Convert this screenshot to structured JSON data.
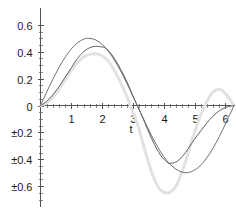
{
  "chart_data": {
    "type": "line",
    "title": "",
    "subtitle": "",
    "xlabel": "t",
    "ylabel": "",
    "xlim": [
      0,
      6.3
    ],
    "ylim": [
      -0.7,
      0.65
    ],
    "grid": false,
    "legend": null,
    "x_ticks": [
      {
        "value": 1,
        "label": "1"
      },
      {
        "value": 2,
        "label": "2"
      },
      {
        "value": 3,
        "label": "3"
      },
      {
        "value": 4,
        "label": "4"
      },
      {
        "value": 5,
        "label": "5"
      },
      {
        "value": 6,
        "label": "6"
      }
    ],
    "y_ticks": [
      {
        "value": 0.6,
        "label": "0.6"
      },
      {
        "value": 0.4,
        "label": "0.4"
      },
      {
        "value": 0.2,
        "label": "0.2"
      },
      {
        "value": 0,
        "label": "0"
      },
      {
        "value": -0.2,
        "label": "±0.2"
      },
      {
        "value": -0.4,
        "label": "±0.4"
      },
      {
        "value": -0.6,
        "label": "±0.6"
      }
    ],
    "series": [
      {
        "name": "curve-1",
        "color": "#707070",
        "width": 1,
        "x": [
          0,
          0.2,
          0.4,
          0.6,
          0.8,
          1.0,
          1.2,
          1.4,
          1.571,
          1.8,
          2.0,
          2.2,
          2.4,
          2.6,
          2.8,
          3.0,
          3.142,
          3.3,
          3.5,
          3.7,
          3.9,
          4.1,
          4.3,
          4.5,
          4.712,
          4.9,
          5.1,
          5.3,
          5.5,
          5.7,
          5.9,
          6.1,
          6.283
        ],
        "y": [
          0,
          0.099,
          0.195,
          0.282,
          0.359,
          0.421,
          0.466,
          0.493,
          0.5,
          0.487,
          0.455,
          0.404,
          0.338,
          0.258,
          0.167,
          0.071,
          0,
          -0.078,
          -0.175,
          -0.265,
          -0.345,
          -0.41,
          -0.456,
          -0.487,
          -0.5,
          -0.492,
          -0.465,
          -0.419,
          -0.355,
          -0.277,
          -0.187,
          -0.09,
          0
        ]
      },
      {
        "name": "curve-2",
        "color": "#606060",
        "width": 1,
        "x": [
          0,
          0.2,
          0.4,
          0.6,
          0.8,
          1.0,
          1.2,
          1.4,
          1.6,
          1.8,
          2.0,
          2.1,
          2.2,
          2.4,
          2.6,
          2.8,
          3.0,
          3.142,
          3.3,
          3.5,
          3.7,
          3.9,
          4.1,
          4.2,
          4.4,
          4.6,
          4.8,
          5.0,
          5.2,
          5.4,
          5.6,
          5.8,
          6.0,
          6.283
        ],
        "y": [
          0,
          0.03,
          0.08,
          0.14,
          0.21,
          0.28,
          0.35,
          0.4,
          0.43,
          0.44,
          0.435,
          0.43,
          0.41,
          0.35,
          0.27,
          0.18,
          0.07,
          0,
          -0.08,
          -0.19,
          -0.29,
          -0.37,
          -0.42,
          -0.43,
          -0.42,
          -0.38,
          -0.32,
          -0.25,
          -0.19,
          -0.13,
          -0.08,
          -0.04,
          -0.015,
          0
        ]
      },
      {
        "name": "curve-3",
        "color": "#e2e2e2",
        "width": 3,
        "x": [
          0,
          0.2,
          0.4,
          0.6,
          0.8,
          1.0,
          1.2,
          1.4,
          1.6,
          1.8,
          2.0,
          2.1,
          2.2,
          2.4,
          2.6,
          2.8,
          3.0,
          3.142,
          3.3,
          3.5,
          3.7,
          3.9,
          4.1,
          4.2,
          4.4,
          4.6,
          4.8,
          4.9,
          5.0,
          5.2,
          5.4,
          5.6,
          5.8,
          6.0,
          6.283
        ],
        "y": [
          0,
          0.02,
          0.06,
          0.12,
          0.19,
          0.26,
          0.32,
          0.36,
          0.38,
          0.385,
          0.37,
          0.35,
          0.33,
          0.26,
          0.17,
          0.07,
          -0.05,
          -0.13,
          -0.26,
          -0.42,
          -0.55,
          -0.63,
          -0.65,
          -0.645,
          -0.6,
          -0.49,
          -0.35,
          -0.27,
          -0.2,
          -0.07,
          0.03,
          0.1,
          0.12,
          0.09,
          0
        ]
      }
    ]
  }
}
